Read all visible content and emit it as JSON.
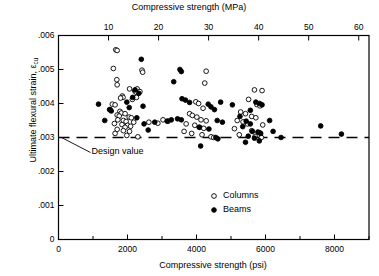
{
  "chart_data": {
    "type": "scatter",
    "title": "",
    "xlabel": "Compressive strength (psi)",
    "xlabel_top": "Compressive strength (MPa)",
    "ylabel": "Ultimate flexural strain, εcu",
    "ylabel_main": "Ultimate flexural strain, ε",
    "ylabel_sub": "cu",
    "xlim": [
      0,
      9000
    ],
    "ylim": [
      0,
      0.006
    ],
    "xlim_top_mpa": [
      0,
      62.05
    ],
    "grid": false,
    "legend_position": "inside-bottom-center",
    "x_ticks": [
      0,
      1000,
      2000,
      3000,
      4000,
      5000,
      6000,
      7000,
      8000,
      9000
    ],
    "x_tick_labels": [
      "0",
      "",
      "2000",
      "",
      "4000",
      "",
      "6000",
      "",
      "8000",
      ""
    ],
    "x_ticks_top_mpa": [
      10,
      20,
      30,
      40,
      50,
      60
    ],
    "x_tick_labels_top": [
      "10",
      "20",
      "30",
      "40",
      "50",
      "60"
    ],
    "y_ticks": [
      0,
      0.001,
      0.002,
      0.003,
      0.004,
      0.005,
      0.006
    ],
    "y_tick_labels": [
      "0",
      ".001",
      ".002",
      ".003",
      ".004",
      ".005",
      ".006"
    ],
    "annotations": [
      {
        "text": "Design value",
        "x": 900,
        "y": 0.00272,
        "kind": "leader-label"
      }
    ],
    "reference_line": {
      "label": "Design value",
      "y": 0.003,
      "style": "dashed",
      "x_from": 0,
      "x_to": 9000
    },
    "series": [
      {
        "name": "Columns",
        "marker": "open-circle",
        "color": "#000000",
        "points": [
          [
            1660,
            0.00558
          ],
          [
            1700,
            0.00556
          ],
          [
            1590,
            0.00503
          ],
          [
            1690,
            0.0047
          ],
          [
            1700,
            0.00455
          ],
          [
            2060,
            0.00443
          ],
          [
            2210,
            0.00437
          ],
          [
            2250,
            0.00433
          ],
          [
            1850,
            0.00422
          ],
          [
            1870,
            0.00418
          ],
          [
            1800,
            0.00416
          ],
          [
            2140,
            0.00412
          ],
          [
            1560,
            0.00398
          ],
          [
            1640,
            0.00396
          ],
          [
            1500,
            0.00382
          ],
          [
            1780,
            0.00377
          ],
          [
            1820,
            0.00372
          ],
          [
            1930,
            0.0037
          ],
          [
            1700,
            0.00366
          ],
          [
            1760,
            0.00363
          ],
          [
            2050,
            0.0036
          ],
          [
            2110,
            0.00358
          ],
          [
            1720,
            0.00352
          ],
          [
            1880,
            0.0035
          ],
          [
            1960,
            0.00347
          ],
          [
            2180,
            0.00345
          ],
          [
            1620,
            0.00341
          ],
          [
            1840,
            0.00338
          ],
          [
            2000,
            0.00336
          ],
          [
            2090,
            0.00333
          ],
          [
            1930,
            0.0033
          ],
          [
            1700,
            0.00324
          ],
          [
            1880,
            0.0032
          ],
          [
            2060,
            0.00318
          ],
          [
            1640,
            0.00312
          ],
          [
            1980,
            0.00306
          ],
          [
            2300,
            0.00302
          ],
          [
            2420,
            0.00498
          ],
          [
            2440,
            0.00492
          ],
          [
            2280,
            0.00443
          ],
          [
            2360,
            0.00435
          ],
          [
            2260,
            0.00418
          ],
          [
            4280,
            0.00495
          ],
          [
            4240,
            0.0046
          ],
          [
            3980,
            0.00405
          ],
          [
            4060,
            0.004
          ],
          [
            4190,
            0.00386
          ],
          [
            3800,
            0.0037
          ],
          [
            3880,
            0.00365
          ],
          [
            4010,
            0.0036
          ],
          [
            4130,
            0.00352
          ],
          [
            4280,
            0.00349
          ],
          [
            3700,
            0.0034
          ],
          [
            3950,
            0.00336
          ],
          [
            4090,
            0.0033
          ],
          [
            4210,
            0.00327
          ],
          [
            3640,
            0.00318
          ],
          [
            3860,
            0.00312
          ],
          [
            4160,
            0.00308
          ],
          [
            4420,
            0.00302
          ],
          [
            4500,
            0.003
          ],
          [
            5680,
            0.0044
          ],
          [
            5900,
            0.00438
          ],
          [
            5510,
            0.00412
          ],
          [
            5750,
            0.00397
          ],
          [
            5840,
            0.00393
          ],
          [
            5280,
            0.00375
          ],
          [
            5420,
            0.0037
          ],
          [
            5600,
            0.00362
          ],
          [
            5720,
            0.00358
          ],
          [
            5180,
            0.0035
          ],
          [
            5350,
            0.00346
          ],
          [
            5480,
            0.0034
          ],
          [
            5920,
            0.00337
          ],
          [
            5100,
            0.00326
          ],
          [
            5600,
            0.0032
          ],
          [
            5830,
            0.00314
          ],
          [
            5240,
            0.00308
          ],
          [
            5700,
            0.00303
          ],
          [
            5880,
            0.003
          ],
          [
            3030,
            0.00352
          ],
          [
            3180,
            0.00348
          ],
          [
            2880,
            0.00342
          ],
          [
            2620,
            0.00345
          ]
        ]
      },
      {
        "name": "Beams",
        "marker": "filled-circle",
        "color": "#000000",
        "points": [
          [
            2400,
            0.0053
          ],
          [
            2220,
            0.0044
          ],
          [
            2330,
            0.0043
          ],
          [
            2450,
            0.00392
          ],
          [
            1160,
            0.00398
          ],
          [
            1480,
            0.00382
          ],
          [
            1530,
            0.00378
          ],
          [
            2150,
            0.00418
          ],
          [
            1980,
            0.00404
          ],
          [
            2050,
            0.00388
          ],
          [
            1340,
            0.0035
          ],
          [
            2270,
            0.00358
          ],
          [
            2480,
            0.0034
          ],
          [
            2600,
            0.00322
          ],
          [
            3520,
            0.005
          ],
          [
            3560,
            0.00494
          ],
          [
            3340,
            0.00464
          ],
          [
            3580,
            0.00414
          ],
          [
            3680,
            0.0041
          ],
          [
            3800,
            0.00403
          ],
          [
            4340,
            0.00398
          ],
          [
            4700,
            0.00404
          ],
          [
            3450,
            0.00355
          ],
          [
            3560,
            0.00352
          ],
          [
            3150,
            0.00348
          ],
          [
            3270,
            0.00352
          ],
          [
            2790,
            0.00345
          ],
          [
            4420,
            0.0039
          ],
          [
            4520,
            0.00382
          ],
          [
            4600,
            0.0035
          ],
          [
            4750,
            0.00345
          ],
          [
            4080,
            0.0033
          ],
          [
            4360,
            0.00325
          ],
          [
            4560,
            0.003
          ],
          [
            4620,
            0.00296
          ],
          [
            4120,
            0.00275
          ],
          [
            5040,
            0.00396
          ],
          [
            5560,
            0.0038
          ],
          [
            5720,
            0.00404
          ],
          [
            5830,
            0.004
          ],
          [
            5900,
            0.00396
          ],
          [
            5260,
            0.00362
          ],
          [
            5440,
            0.00348
          ],
          [
            5560,
            0.0034
          ],
          [
            5340,
            0.00332
          ],
          [
            5620,
            0.00318
          ],
          [
            5780,
            0.00316
          ],
          [
            5860,
            0.00312
          ],
          [
            5500,
            0.00304
          ],
          [
            5680,
            0.00298
          ],
          [
            5420,
            0.00286
          ],
          [
            5820,
            0.0029
          ],
          [
            6120,
            0.0035
          ],
          [
            6220,
            0.00318
          ],
          [
            6450,
            0.003
          ],
          [
            7600,
            0.00334
          ],
          [
            8200,
            0.0031
          ]
        ]
      }
    ]
  },
  "legend": {
    "entries": [
      {
        "label": "Columns",
        "marker": "open-circle"
      },
      {
        "label": "Beams",
        "marker": "filled-circle"
      }
    ]
  },
  "axes": {
    "top_title": "Compressive strength (MPa)",
    "bottom_title": "Compressive strength (psi)",
    "y_title_main": "Ultimate flexural strain, ε",
    "y_title_sub": "cu"
  },
  "colors": {
    "axis": "#000000",
    "marker": "#000000",
    "background": "#ffffff"
  }
}
